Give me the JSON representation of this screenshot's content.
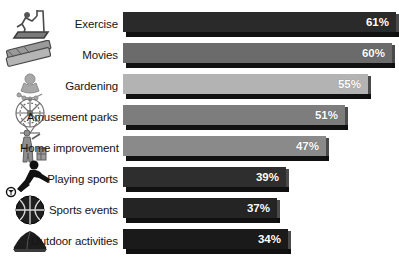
{
  "chart_data": {
    "type": "bar",
    "orientation": "horizontal",
    "title": "",
    "xlabel": "",
    "ylabel": "",
    "xlim": [
      0,
      65
    ],
    "grid": false,
    "legend": false,
    "value_suffix": "%",
    "categories": [
      "Exercise",
      "Movies",
      "Gardening",
      "Amusement parks",
      "Home improvement",
      "Playing sports",
      "Sports events",
      "Outdoor activities"
    ],
    "values": [
      61,
      60,
      55,
      51,
      47,
      39,
      37,
      34
    ],
    "value_labels": [
      "61%",
      "60%",
      "55%",
      "51%",
      "47%",
      "39%",
      "37%",
      "34%"
    ],
    "bar_colors": [
      "#2a2a2a",
      "#6b6b6b",
      "#b3b3b3",
      "#7d7d7d",
      "#8a8a8a",
      "#2e2e2e",
      "#242424",
      "#1a1a1a"
    ],
    "icons": [
      "treadmill-icon",
      "movie-tickets-icon",
      "gardening-icon",
      "ferris-wheel-icon",
      "home-improvement-icon",
      "soccer-player-icon",
      "basketball-icon",
      "camping-tent-icon"
    ],
    "bar_px_widths": [
      273,
      269,
      245,
      222,
      203,
      163,
      154,
      165
    ]
  }
}
